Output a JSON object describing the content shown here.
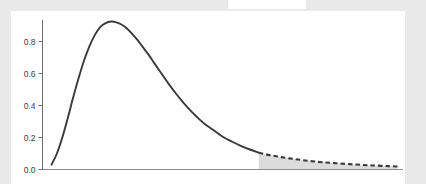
{
  "figure": {
    "background_color": "#e9e9e9",
    "panel_color": "#ffffff",
    "curve_color": "#3a3a3a",
    "shade_color": "#dcdcdc",
    "axis_color": "#8c8c8c"
  },
  "chart_data": {
    "type": "line",
    "title": "",
    "subtitle": "",
    "xlabel": "",
    "ylabel": "",
    "grid": false,
    "legend": null,
    "xlim": [
      0,
      10
    ],
    "ylim": [
      0,
      1.0
    ],
    "xticks": [],
    "xticklabels": [],
    "yticks": [
      0.0,
      0.2,
      0.4,
      0.6,
      0.8
    ],
    "yticklabels": [
      "0.0",
      "0.2",
      "0.4",
      "0.6",
      "0.8"
    ],
    "series": [
      {
        "name": "density",
        "style": "solid",
        "color": "#3a3a3a",
        "x": [
          0.25,
          0.4,
          0.55,
          0.7,
          0.85,
          1.0,
          1.15,
          1.3,
          1.45,
          1.6,
          1.75,
          1.9,
          2.05,
          2.2,
          2.35,
          2.5,
          2.65,
          2.8,
          2.95,
          3.1,
          3.3,
          3.5,
          3.7,
          3.9,
          4.1,
          4.3,
          4.5,
          4.75,
          5.0,
          5.25,
          5.5,
          5.75,
          6.0
        ],
        "y": [
          0.03,
          0.1,
          0.2,
          0.32,
          0.45,
          0.57,
          0.68,
          0.77,
          0.84,
          0.89,
          0.915,
          0.925,
          0.92,
          0.905,
          0.88,
          0.845,
          0.805,
          0.76,
          0.715,
          0.665,
          0.6,
          0.535,
          0.475,
          0.42,
          0.37,
          0.325,
          0.285,
          0.245,
          0.205,
          0.175,
          0.148,
          0.125,
          0.105
        ]
      },
      {
        "name": "density-tail",
        "style": "dashed",
        "color": "#3a3a3a",
        "shaded": true,
        "shade_color": "#dcdcdc",
        "x": [
          6.0,
          6.3,
          6.6,
          6.9,
          7.2,
          7.5,
          7.8,
          8.1,
          8.4,
          8.7,
          9.0,
          9.3,
          9.6,
          9.85
        ],
        "y": [
          0.105,
          0.09,
          0.078,
          0.068,
          0.059,
          0.051,
          0.045,
          0.04,
          0.035,
          0.031,
          0.027,
          0.024,
          0.021,
          0.019
        ]
      }
    ],
    "annotations": [
      {
        "name": "tail-shaded-area",
        "type": "area-fill",
        "x_start": 6.0,
        "x_end": 9.85,
        "color": "#dcdcdc"
      }
    ]
  }
}
